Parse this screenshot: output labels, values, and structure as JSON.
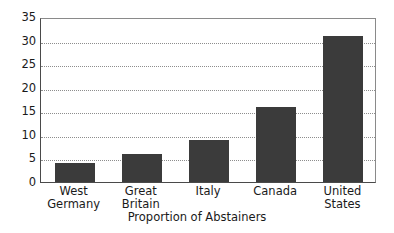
{
  "chart_data": {
    "type": "bar",
    "title": "",
    "xlabel": "Proportion of Abstainers",
    "ylabel": "",
    "categories": [
      "West Germany",
      "Great Britain",
      "Italy",
      "Canada",
      "United States"
    ],
    "category_lines": [
      [
        "West",
        "Germany"
      ],
      [
        "Great",
        "Britain"
      ],
      [
        "Italy",
        ""
      ],
      [
        "Canada",
        ""
      ],
      [
        "United",
        "States"
      ]
    ],
    "values": [
      4,
      6,
      9,
      16,
      31
    ],
    "ylim": [
      0,
      35
    ],
    "ytick_labels": [
      "0",
      "5",
      "10",
      "15",
      "20",
      "25",
      "30",
      "35"
    ],
    "ytick_values": [
      0,
      5,
      10,
      15,
      20,
      25,
      30,
      35
    ],
    "grid": true,
    "grid_style": "dotted",
    "grid_axis": "y",
    "legend": "none",
    "bar_color": "#3b3b3b",
    "grid_color": "#8d8d8d",
    "axis_color": "#4a4a4a",
    "background_color": "#ffffff"
  }
}
